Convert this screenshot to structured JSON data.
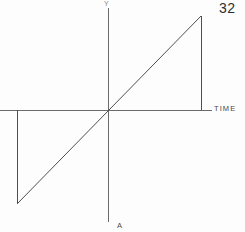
{
  "page": {
    "number": "32",
    "background_color": "#fdfdfd",
    "ink_color": "#5a5a5a",
    "width": 245,
    "height": 232
  },
  "figure": {
    "bottom_label": "A",
    "y_axis_label": "Y",
    "x_axis_label": "TIME"
  },
  "chart_data": {
    "type": "line",
    "title": "",
    "subtitle": "",
    "xlabel": "TIME",
    "ylabel": "Y",
    "grid": false,
    "legend": null,
    "annotations": [
      {
        "text": "Y",
        "position": "top-of-vertical-axis"
      },
      {
        "text": "TIME",
        "position": "right-of-horizontal-axis"
      },
      {
        "text": "A",
        "position": "below-vertical-axis"
      },
      {
        "text": "32",
        "position": "top-right-page-number"
      }
    ],
    "axis_ranges": {
      "xlim": [
        -1.18,
        1.16
      ],
      "ylim": [
        -1.0,
        1.0
      ]
    },
    "series": [
      {
        "name": "sawtooth-ramp",
        "x": [
          -0.98,
          -0.98,
          0.0,
          1.0,
          1.0
        ],
        "y": [
          0.0,
          -1.0,
          0.0,
          1.0,
          0.0
        ],
        "points_px": [
          {
            "x": 17,
            "y": 110
          },
          {
            "x": 17,
            "y": 204
          },
          {
            "x": 108,
            "y": 110
          },
          {
            "x": 201,
            "y": 16
          },
          {
            "x": 201,
            "y": 110
          }
        ]
      }
    ],
    "axes_px": {
      "vertical_axis": {
        "x": 108,
        "y_top": 8,
        "y_bottom": 222
      },
      "horizontal_axis": {
        "y": 110,
        "x_left": 0,
        "x_right": 212
      },
      "origin": {
        "x": 108,
        "y": 110
      }
    }
  }
}
